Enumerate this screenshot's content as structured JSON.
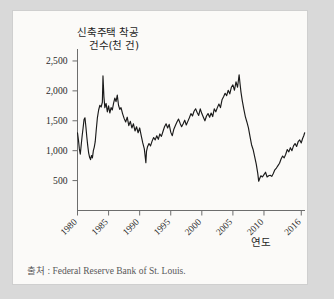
{
  "figure": {
    "y_axis_title": "신축주택 착공\n건수(천 건)",
    "x_axis_title": "연도",
    "source_note": "출처 : Federal Reserve Bank of St. Louis."
  },
  "chart_data": {
    "type": "line",
    "title": "",
    "subtitle": "",
    "xlabel": "연도",
    "ylabel": "신축주택 착공 건수(천 건)",
    "xlim": [
      1980,
      2016.6
    ],
    "ylim": [
      0,
      2700
    ],
    "grid": false,
    "legend": null,
    "line_color": "#1a1a1a",
    "axis_color": "#6d6d6d",
    "background_color": "#fbfaf8",
    "page_background_color": "#d9d9d9",
    "y_ticks": [
      500,
      1000,
      1500,
      2000,
      2500
    ],
    "y_tick_labels": [
      "500",
      "1,000",
      "1,500",
      "2,000",
      "2,500"
    ],
    "x_ticks": [
      1980,
      1985,
      1990,
      1995,
      2000,
      2005,
      2010,
      2016
    ],
    "x_tick_labels": [
      "1980",
      "1985",
      "1990",
      "1995",
      "2000",
      "2005",
      "2010",
      "2016"
    ],
    "x_tick_label_rotation_deg": 45,
    "series": [
      {
        "name": "신축주택 착공 건수",
        "units": "천 건",
        "x": [
          1980.0,
          1980.15,
          1980.3,
          1980.45,
          1980.6,
          1980.75,
          1980.9,
          1981.05,
          1981.2,
          1981.35,
          1981.5,
          1981.65,
          1981.8,
          1981.95,
          1982.1,
          1982.25,
          1982.4,
          1982.55,
          1982.7,
          1982.85,
          1983.0,
          1983.2,
          1983.4,
          1983.6,
          1983.8,
          1984.0,
          1984.1,
          1984.25,
          1984.4,
          1984.6,
          1984.8,
          1985.0,
          1985.2,
          1985.4,
          1985.6,
          1985.8,
          1986.0,
          1986.2,
          1986.4,
          1986.6,
          1986.8,
          1987.0,
          1987.25,
          1987.5,
          1987.75,
          1988.0,
          1988.25,
          1988.5,
          1988.75,
          1989.0,
          1989.25,
          1989.5,
          1989.75,
          1990.0,
          1990.25,
          1990.5,
          1990.75,
          1991.0,
          1991.1,
          1991.25,
          1991.5,
          1991.75,
          1992.0,
          1992.25,
          1992.5,
          1992.75,
          1993.0,
          1993.25,
          1993.5,
          1993.75,
          1994.0,
          1994.25,
          1994.5,
          1994.75,
          1995.0,
          1995.25,
          1995.5,
          1995.75,
          1996.0,
          1996.25,
          1996.5,
          1996.75,
          1997.0,
          1997.25,
          1997.5,
          1997.75,
          1998.0,
          1998.25,
          1998.5,
          1998.75,
          1999.0,
          1999.25,
          1999.5,
          1999.75,
          2000.0,
          2000.25,
          2000.5,
          2000.75,
          2001.0,
          2001.25,
          2001.5,
          2001.75,
          2002.0,
          2002.25,
          2002.5,
          2002.75,
          2003.0,
          2003.25,
          2003.5,
          2003.75,
          2004.0,
          2004.25,
          2004.5,
          2004.75,
          2005.0,
          2005.25,
          2005.5,
          2005.75,
          2006.0,
          2006.15,
          2006.3,
          2006.5,
          2006.75,
          2007.0,
          2007.25,
          2007.5,
          2007.75,
          2008.0,
          2008.25,
          2008.5,
          2008.75,
          2009.0,
          2009.15,
          2009.3,
          2009.5,
          2009.75,
          2010.0,
          2010.25,
          2010.5,
          2010.75,
          2011.0,
          2011.25,
          2011.5,
          2011.75,
          2012.0,
          2012.25,
          2012.5,
          2012.75,
          2013.0,
          2013.25,
          2013.5,
          2013.75,
          2014.0,
          2014.25,
          2014.5,
          2014.75,
          2015.0,
          2015.25,
          2015.5,
          2015.75,
          2016.0,
          2016.2,
          2016.4,
          2016.55
        ],
        "y": [
          1300,
          1180,
          1030,
          940,
          1100,
          1250,
          1380,
          1520,
          1550,
          1400,
          1230,
          1080,
          960,
          890,
          850,
          920,
          880,
          1000,
          1060,
          1150,
          1330,
          1550,
          1680,
          1760,
          1730,
          1810,
          2250,
          1900,
          1720,
          1790,
          1650,
          1750,
          1630,
          1720,
          1680,
          1790,
          1880,
          1820,
          1930,
          1760,
          1690,
          1720,
          1620,
          1540,
          1480,
          1560,
          1420,
          1490,
          1380,
          1450,
          1330,
          1400,
          1300,
          1380,
          1250,
          1130,
          1030,
          800,
          990,
          1060,
          1120,
          1080,
          1160,
          1220,
          1180,
          1250,
          1190,
          1280,
          1240,
          1320,
          1400,
          1450,
          1380,
          1440,
          1310,
          1250,
          1360,
          1420,
          1480,
          1530,
          1460,
          1400,
          1450,
          1510,
          1430,
          1490,
          1550,
          1620,
          1580,
          1660,
          1700,
          1640,
          1590,
          1700,
          1620,
          1560,
          1500,
          1580,
          1620,
          1560,
          1630,
          1570,
          1700,
          1650,
          1720,
          1780,
          1720,
          1850,
          1900,
          1960,
          1920,
          2010,
          1950,
          2060,
          2100,
          2010,
          2150,
          2060,
          2270,
          2120,
          1980,
          1840,
          1700,
          1570,
          1480,
          1380,
          1240,
          1100,
          1020,
          900,
          780,
          620,
          490,
          530,
          580,
          560,
          600,
          640,
          560,
          580,
          590,
          570,
          620,
          680,
          710,
          750,
          790,
          860,
          910,
          880,
          940,
          1020,
          980,
          1050,
          1000,
          1080,
          1120,
          1070,
          1150,
          1180,
          1130,
          1200,
          1250,
          1300
        ]
      }
    ]
  }
}
